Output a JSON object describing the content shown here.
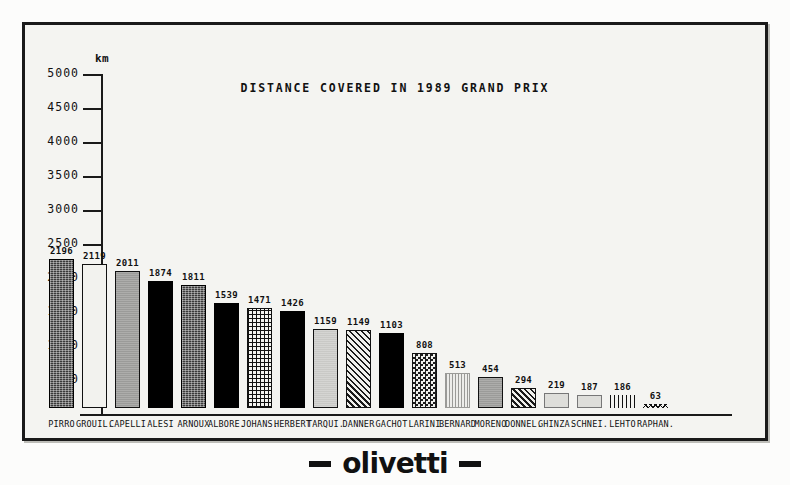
{
  "frame": {
    "background_color": "#f4f4f1",
    "border_color": "#1a1a1a"
  },
  "footer": {
    "logo_text": "olivetti",
    "dash_left": "",
    "dash_right": ""
  },
  "chart_data": {
    "type": "bar",
    "title": "DISTANCE COVERED IN 1989 GRAND PRIX",
    "xlabel": "",
    "ylabel": "km",
    "unit_label": "km",
    "ylim": [
      0,
      5000
    ],
    "ytick_step": 500,
    "yticks": [
      5000,
      4500,
      4000,
      3500,
      3000,
      2500,
      2000,
      1500,
      1000,
      500
    ],
    "ytick_labels": [
      "5000",
      "4500",
      "4000",
      "3500",
      "3000",
      "2500",
      "2000",
      "1500",
      "1000",
      "500"
    ],
    "grid": false,
    "legend": false,
    "show_value_labels": true,
    "categories": [
      "PIRRO",
      "GROUIL.",
      "CAPELLI",
      "ALESI",
      "ARNOUX",
      "ALBORE.",
      "JOHANS.",
      "HERBERT",
      "TARQUI.",
      "DANNER",
      "GACHOT",
      "LARINI",
      "BERNARD",
      "MORENO",
      "DONNEL.",
      "GHINZA.",
      "SCHNEI.",
      "LEHTO",
      "RAPHAN."
    ],
    "values": [
      2196,
      2119,
      2011,
      1874,
      1811,
      1539,
      1471,
      1426,
      1159,
      1149,
      1103,
      808,
      513,
      454,
      294,
      219,
      187,
      186,
      63
    ],
    "value_labels": [
      "2196",
      "2119",
      "2011",
      "1874",
      "1811",
      "1539",
      "1471",
      "1426",
      "1159",
      "1149",
      "1103",
      "808",
      "513",
      "454",
      "294",
      "219",
      "187",
      "186",
      "63"
    ],
    "bar_patterns": [
      "dark-speckle",
      "white",
      "mid-gray",
      "solid-black",
      "dark-speckle",
      "solid-black",
      "grid",
      "solid-black",
      "light-gray",
      "diag",
      "solid-black",
      "checker",
      "vlines",
      "mid-gray",
      "diag",
      "pale-gray",
      "pale-gray",
      "vlines-dark",
      "zigzag"
    ]
  }
}
